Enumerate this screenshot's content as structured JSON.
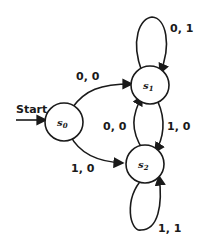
{
  "diagram": {
    "type": "finite-state-machine",
    "start_label": "Start",
    "states": [
      {
        "id": "s0",
        "base": "s",
        "sub": "0"
      },
      {
        "id": "s1",
        "base": "s",
        "sub": "1"
      },
      {
        "id": "s2",
        "base": "s",
        "sub": "2"
      }
    ],
    "transitions": [
      {
        "from": "s0",
        "to": "s1",
        "label": "0, 0"
      },
      {
        "from": "s0",
        "to": "s2",
        "label": "1, 0"
      },
      {
        "from": "s1",
        "to": "s1",
        "label": "0, 1"
      },
      {
        "from": "s1",
        "to": "s2",
        "label": "1, 0"
      },
      {
        "from": "s2",
        "to": "s1",
        "label": "0, 0"
      },
      {
        "from": "s2",
        "to": "s2",
        "label": "1, 1"
      }
    ],
    "colors": {
      "stroke": "#1a1a1a",
      "background": "#ffffff"
    }
  }
}
